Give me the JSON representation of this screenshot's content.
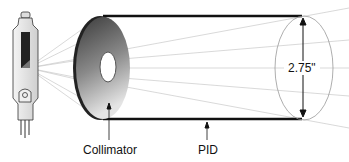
{
  "diagram": {
    "labels": {
      "collimator": "Collimator",
      "pid": "PID",
      "diameter": "2.75\""
    },
    "parts": [
      "x-ray-tube",
      "collimator-disk",
      "pid-cylinder",
      "beam-rays",
      "diameter-arrow"
    ],
    "colors": {
      "line": "#111111",
      "ray": "#bbbbbb",
      "disk_dark": "#333333",
      "disk_light": "#dddddd"
    }
  }
}
